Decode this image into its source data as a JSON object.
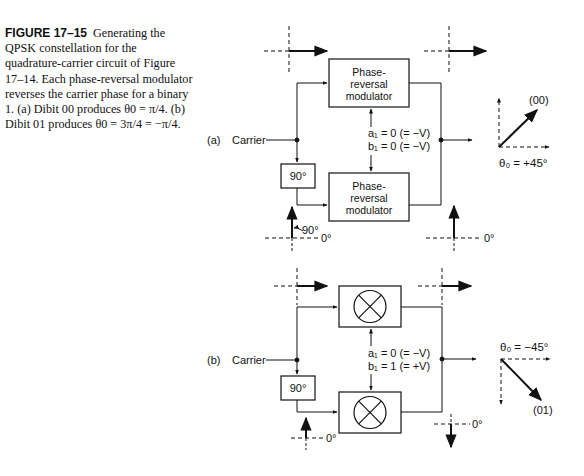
{
  "caption": {
    "figure_label": "FIGURE 17–15",
    "text": "Generating the QPSK constellation for the quadrature-carrier circuit of Figure 17–14. Each phase-reversal modulator reverses the carrier phase for a binary 1. (a) Dibit 00 produces θ0 = π/4. (b) Dibit 01 produces θ0 = 3π/4 = −π/4."
  },
  "panel_a": {
    "label": "(a)",
    "carrier_label": "Carrier",
    "shifter_label": "90°",
    "top_modulator": [
      "Phase-",
      "reversal",
      "modulator"
    ],
    "bottom_modulator": [
      "Phase-",
      "reversal",
      "modulator"
    ],
    "a1": "a₁ = 0 (= −V)",
    "b1": "b₁ = 0 (= −V)",
    "phasor_90": "90°",
    "phasor_0_left": "0°",
    "phasor_0_right": "0°",
    "output_dibit": "(00)",
    "theta": "θ₀ = +45°"
  },
  "panel_b": {
    "label": "(b)",
    "carrier_label": "Carrier",
    "shifter_label": "90°",
    "a1": "a₁ = 0 (= −V)",
    "b1": "b₁ = 1 (= +V)",
    "phasor_0_left": "0°",
    "phasor_0_right": "0°",
    "output_dibit": "(01)",
    "theta": "θ₀ = −45°"
  }
}
